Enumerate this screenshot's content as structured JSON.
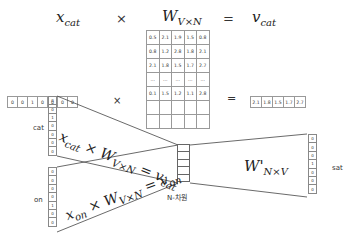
{
  "equation": {
    "x_term": "x",
    "x_sub": "cat",
    "times": "×",
    "w_term": "W",
    "w_sub": "V×N",
    "equals": "=",
    "v_term": "v",
    "v_sub": "cat"
  },
  "example": {
    "one_hot": [
      "0",
      "0",
      "1",
      "0",
      "0",
      "0",
      "0"
    ],
    "times": "×",
    "equals": "=",
    "matrix": [
      [
        "0.5",
        "2.1",
        "1.9",
        "1.5",
        "0.8"
      ],
      [
        "0.8",
        "1.2",
        "2.8",
        "1.8",
        "2.1"
      ],
      [
        "2.1",
        "1.8",
        "1.5",
        "1.7",
        "2.7"
      ],
      [
        "...",
        "...",
        "...",
        "...",
        "..."
      ],
      [
        "0.1",
        "1.5",
        "1.2",
        "1.1",
        "2.8"
      ],
      [
        "",
        "",
        "",
        "",
        ""
      ],
      [
        "",
        "",
        "",
        "",
        ""
      ]
    ],
    "result": [
      "2.1",
      "1.8",
      "1.5",
      "1.7",
      "2.7"
    ]
  },
  "network": {
    "cat_label": "cat",
    "cat_vector": [
      "0",
      "0",
      "1",
      "0",
      "0",
      "0",
      "0"
    ],
    "on_label": "on",
    "on_vector": [
      "0",
      "0",
      "0",
      "0",
      "1",
      "0",
      "0"
    ],
    "sat_label": "sat",
    "sat_vector": [
      "0",
      "0",
      "0",
      "1",
      "0",
      "0",
      "0"
    ],
    "hidden_label": "N-차원",
    "hidden_cells": 5,
    "cat_formula": {
      "x": "x",
      "x_sub": "cat",
      "times": "×",
      "w": "W",
      "w_sub": "V×N",
      "eq": "=",
      "v": "v",
      "v_sub": "cat"
    },
    "on_formula": {
      "x": "x",
      "x_sub": "on",
      "times": "×",
      "w": "W",
      "w_sub": "V×N",
      "eq": "=",
      "v": "v",
      "v_sub": "on"
    },
    "output_weight": {
      "w": "W'",
      "w_sub": "N×V"
    }
  }
}
